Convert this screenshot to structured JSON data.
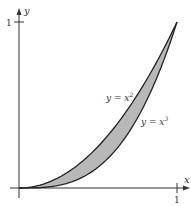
{
  "chart_data": {
    "type": "area",
    "title": "",
    "xlabel": "x",
    "ylabel": "y",
    "xlim": [
      0,
      1
    ],
    "ylim": [
      0,
      1
    ],
    "x_ticks": [
      "1"
    ],
    "y_ticks": [
      "1"
    ],
    "grid": false,
    "series": [
      {
        "name": "y = x^2",
        "label": "y = x",
        "exponent": "2",
        "x": [
          0,
          0.1,
          0.2,
          0.3,
          0.4,
          0.5,
          0.6,
          0.7,
          0.8,
          0.9,
          1.0
        ],
        "values": [
          0,
          0.01,
          0.04,
          0.09,
          0.16,
          0.25,
          0.36,
          0.49,
          0.64,
          0.81,
          1.0
        ]
      },
      {
        "name": "y = x^3",
        "label": "y = x",
        "exponent": "3",
        "x": [
          0,
          0.1,
          0.2,
          0.3,
          0.4,
          0.5,
          0.6,
          0.7,
          0.8,
          0.9,
          1.0
        ],
        "values": [
          0,
          0.001,
          0.008,
          0.027,
          0.064,
          0.125,
          0.216,
          0.343,
          0.512,
          0.729,
          1.0
        ]
      }
    ],
    "shaded_region": "between y = x^2 and y = x^3 for 0 <= x <= 1",
    "colors": {
      "fill": "#b8b8b8",
      "stroke": "#222222",
      "axis": "#333333"
    }
  }
}
